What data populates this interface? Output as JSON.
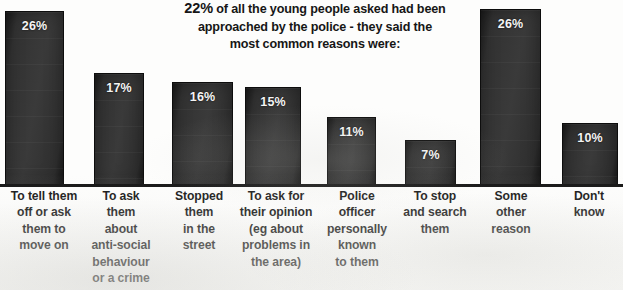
{
  "headline": {
    "clipped_top_line": "of the young people",
    "lead_percent": "22%",
    "line1_rest": " of all the young people asked had been",
    "line2": "approached by the police - they said the",
    "line3": "most common reasons were:"
  },
  "chart_data": {
    "type": "bar",
    "title": "22% of all the young people asked had been approached by the police - they said the most common reasons were:",
    "xlabel": "",
    "ylabel": "",
    "ylim": [
      0,
      28
    ],
    "grid": false,
    "legend": "none",
    "value_suffix": "%",
    "categories": [
      "To tell them off or ask them to move on",
      "To ask them about anti-social behaviour or a crime",
      "Stopped them in the street",
      "To ask for their opinion (eg about problems in the area)",
      "Police officer personally known to them",
      "To stop and search them",
      "Some other reason",
      "Don't know"
    ],
    "values": [
      26,
      17,
      16,
      15,
      11,
      7,
      26,
      10
    ],
    "value_labels": [
      "26%",
      "17%",
      "16%",
      "15%",
      "11%",
      "7%",
      "26%",
      "10%"
    ],
    "category_lines": [
      [
        "To tell them",
        "off or ask",
        "them to",
        "move on"
      ],
      [
        "To ask",
        "them",
        "about",
        "anti-social",
        "behaviour",
        "or a crime"
      ],
      [
        "Stopped",
        "them",
        "in the",
        "street"
      ],
      [
        "To ask for",
        "their opinion",
        "(eg about",
        "problems in",
        "the area)"
      ],
      [
        "Police",
        "officer",
        "personally",
        "known",
        "to them"
      ],
      [
        "To stop",
        "and search",
        "them"
      ],
      [
        "Some",
        "other",
        "reason"
      ],
      [
        "Don't",
        "know"
      ]
    ],
    "bar_geometry": [
      {
        "left": 5,
        "width": 59,
        "top": 10
      },
      {
        "left": 94,
        "width": 50,
        "top": 72
      },
      {
        "left": 172,
        "width": 61,
        "top": 81
      },
      {
        "left": 245,
        "width": 56,
        "top": 86
      },
      {
        "left": 327,
        "width": 49,
        "top": 116
      },
      {
        "left": 405,
        "width": 51,
        "top": 139
      },
      {
        "left": 480,
        "width": 61,
        "top": 8
      },
      {
        "left": 562,
        "width": 56,
        "top": 122
      }
    ],
    "label_geometry": [
      {
        "left": 0,
        "width": 88
      },
      {
        "left": 84,
        "width": 74
      },
      {
        "left": 163,
        "width": 72
      },
      {
        "left": 233,
        "width": 86
      },
      {
        "left": 318,
        "width": 78
      },
      {
        "left": 395,
        "width": 80
      },
      {
        "left": 477,
        "width": 68
      },
      {
        "left": 556,
        "width": 66
      }
    ]
  },
  "colors": {
    "bar_fill": "#333333",
    "bar_edge": "#0d0d0d",
    "value_text": "#f4f4f4",
    "label_text": "#121212",
    "axis": "#111111",
    "background": "#fdfdfc"
  }
}
